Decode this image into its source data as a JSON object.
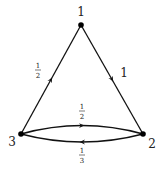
{
  "diagram": {
    "type": "directed-weighted-graph",
    "nodes": [
      {
        "id": "1",
        "label": "1",
        "x": 81,
        "y": 25
      },
      {
        "id": "2",
        "label": "2",
        "x": 143,
        "y": 134
      },
      {
        "id": "3",
        "label": "3",
        "x": 21,
        "y": 134
      }
    ],
    "edges": [
      {
        "from": "1",
        "to": "2",
        "weight": "1",
        "weight_num": "1"
      },
      {
        "from": "3",
        "to": "1",
        "weight": "1/2",
        "weight_num": "1",
        "weight_den": "2"
      },
      {
        "from": "3",
        "to": "2",
        "weight": "1/2",
        "weight_num": "1",
        "weight_den": "2"
      },
      {
        "from": "2",
        "to": "3",
        "weight": "1/3",
        "weight_num": "1",
        "weight_den": "3"
      }
    ]
  }
}
